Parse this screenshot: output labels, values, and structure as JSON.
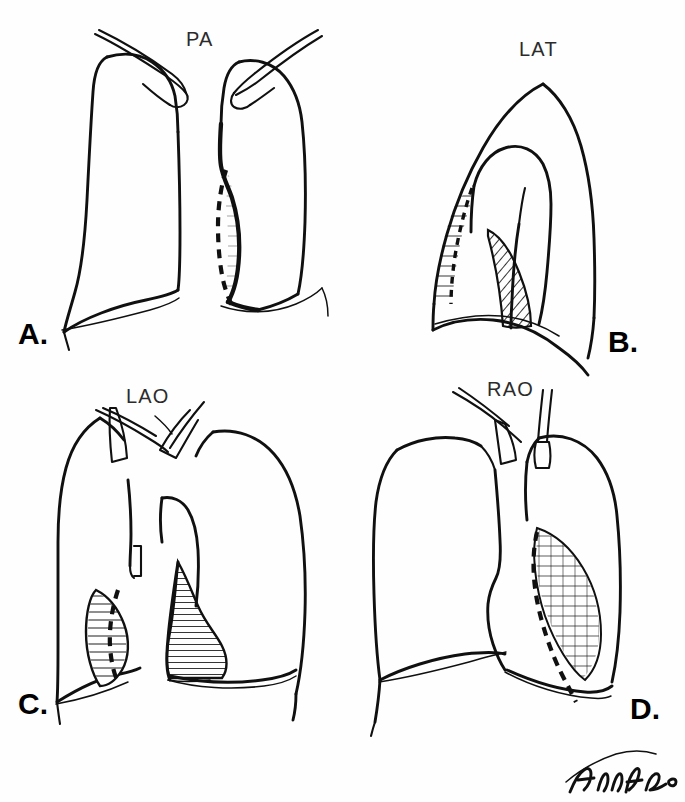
{
  "figure": {
    "type": "medical-line-illustration",
    "background_color": "#ffffff",
    "ink_color": "#101010",
    "label_color": "#2b2b2b",
    "panel_count": 4,
    "signature": {
      "name": "artist-signature",
      "legible_text": "",
      "description": "cursive handwritten signature"
    }
  },
  "panels": [
    {
      "id": "A",
      "letter": "A.",
      "view_label": "PA",
      "view_name": "posteroanterior",
      "position": "top-left",
      "features": {
        "dashed_border": true,
        "hatched_region": false,
        "stippled_region": false,
        "clavicles": true
      }
    },
    {
      "id": "B",
      "letter": "B.",
      "view_label": "LAT",
      "view_name": "lateral",
      "position": "top-right",
      "features": {
        "dashed_border": true,
        "hatched_region": true,
        "stippled_region": true,
        "clavicles": false
      }
    },
    {
      "id": "C",
      "letter": "C.",
      "view_label": "LAO",
      "view_name": "left anterior oblique",
      "position": "bottom-left",
      "features": {
        "dashed_border": true,
        "hatched_region": true,
        "stippled_region": true,
        "clavicles": true
      }
    },
    {
      "id": "D",
      "letter": "D.",
      "view_label": "RAO",
      "view_name": "right anterior oblique",
      "position": "bottom-right",
      "features": {
        "dashed_border": true,
        "hatched_region": false,
        "stippled_region": true,
        "clavicles": true
      }
    }
  ]
}
